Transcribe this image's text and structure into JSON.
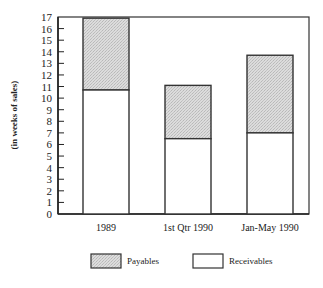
{
  "chart_data": {
    "type": "bar",
    "stacked": true,
    "title": "",
    "xlabel": "",
    "ylabel": "(in weeks of sales)",
    "ylim": [
      0,
      17
    ],
    "yticks": [
      0,
      1,
      2,
      3,
      4,
      5,
      6,
      7,
      8,
      9,
      10,
      11,
      12,
      13,
      14,
      15,
      16,
      17
    ],
    "categories": [
      "1989",
      "1st Qtr 1990",
      "Jan-May 1990"
    ],
    "series": [
      {
        "name": "Receivables",
        "values": [
          10.7,
          6.5,
          7.0
        ],
        "color": "#ffffff"
      },
      {
        "name": "Payables",
        "values": [
          6.2,
          4.6,
          6.7
        ],
        "color": "#d6d6d6"
      }
    ],
    "totals": [
      16.9,
      11.1,
      13.7
    ],
    "grid": false,
    "legend_position": "bottom"
  },
  "legend": {
    "items": [
      {
        "label": "Payables",
        "swatch": "#d6d6d6"
      },
      {
        "label": "Receivables",
        "swatch": "#ffffff"
      }
    ]
  }
}
